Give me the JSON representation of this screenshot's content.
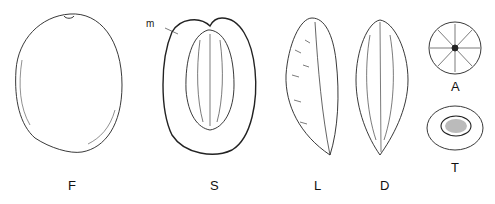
{
  "figure": {
    "panels": [
      {
        "id": "F",
        "label": "F"
      },
      {
        "id": "S",
        "label": "S",
        "callout": "m"
      },
      {
        "id": "L",
        "label": "L"
      },
      {
        "id": "D",
        "label": "D"
      },
      {
        "id": "A",
        "label": "A"
      },
      {
        "id": "T",
        "label": "T"
      }
    ]
  }
}
